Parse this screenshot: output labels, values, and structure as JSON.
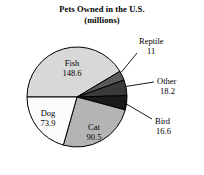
{
  "chart_data": {
    "type": "pie",
    "title": "Pets Owned in the U.S. (millions)",
    "title_line1": "Pets Owned in the U.S.",
    "title_line2": "(millions)",
    "xlabel": "",
    "ylabel": "",
    "units": "millions",
    "legend": "none",
    "grid": false,
    "start_angle_deg": 180,
    "direction": "clockwise",
    "total": 358.8,
    "categories": [
      "Fish",
      "Reptile",
      "Other",
      "Bird",
      "Cat",
      "Dog"
    ],
    "values": [
      148.6,
      11,
      18.2,
      16.6,
      90.5,
      73.9
    ],
    "slices": [
      {
        "label": "Fish",
        "value": "148.6",
        "number": 148.6,
        "fill": "#d8d8d8",
        "label_style": "inside"
      },
      {
        "label": "Reptile",
        "value": "11",
        "number": 11,
        "fill": "#5a5a5a",
        "label_style": "callout"
      },
      {
        "label": "Other",
        "value": "18.2",
        "number": 18.2,
        "fill": "#3a3a3a",
        "label_style": "callout"
      },
      {
        "label": "Bird",
        "value": "16.6",
        "number": 16.6,
        "fill": "#1a1a1a",
        "label_style": "callout"
      },
      {
        "label": "Cat",
        "value": "90.5",
        "number": 90.5,
        "fill": "#b4b4b4",
        "label_style": "inside"
      },
      {
        "label": "Dog",
        "value": "73.9",
        "number": 73.9,
        "fill": "#fbfbfb",
        "label_style": "inside"
      }
    ],
    "colors": {
      "fish": "#d8d8d8",
      "reptile": "#5a5a5a",
      "other": "#3a3a3a",
      "bird": "#1a1a1a",
      "cat": "#b4b4b4",
      "dog": "#fbfbfb",
      "outline": "#000000",
      "background": "#ffffff"
    }
  }
}
